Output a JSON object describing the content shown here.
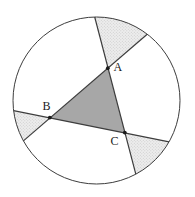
{
  "diagram": {
    "point_labels": {
      "a": "A",
      "b": "B",
      "c": "C"
    },
    "colors": {
      "background": "#ffffff",
      "outline": "#3d3d3d",
      "triangle_fill": "#a7a7a7",
      "stipple_base": "#ededed",
      "stipple_dot": "#c6c6c6",
      "point_dot": "#1a1a1a",
      "label_text": "#1a1a1a"
    }
  }
}
